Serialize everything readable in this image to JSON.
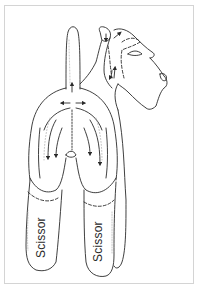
{
  "diagram": {
    "labels": [
      {
        "id": "left-leg",
        "text": "Scissor"
      },
      {
        "id": "right-leg",
        "text": "Scissor"
      }
    ],
    "colors": {
      "line": "#2a2a2a",
      "frame": "#d4d4d4",
      "background": "#ffffff"
    }
  }
}
